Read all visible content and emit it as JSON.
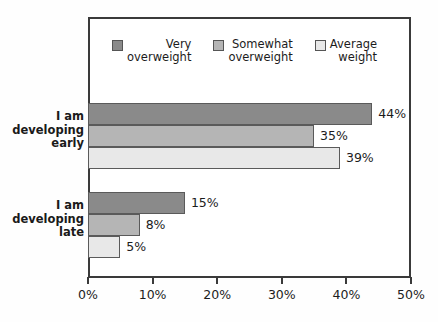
{
  "chart_data": {
    "type": "bar",
    "orientation": "horizontal",
    "title": "",
    "xlabel": "",
    "ylabel": "",
    "categories": [
      "I am developing early",
      "I am developing late"
    ],
    "category_lines": [
      [
        "I am",
        "developing",
        "early"
      ],
      [
        "I am",
        "developing",
        "late"
      ]
    ],
    "series": [
      {
        "name": "Very overweight",
        "name_lines": [
          "Very",
          "overweight"
        ],
        "color": "#8a8a8a",
        "values": [
          44,
          35
        ],
        "labels": [
          "44%",
          "8%"
        ]
      },
      {
        "name": "Somewhat overweight",
        "name_lines": [
          "Somewhat",
          "overweight"
        ],
        "color": "#b5b5b5",
        "values": [
          35,
          8
        ],
        "labels": [
          "35%",
          "8%"
        ]
      },
      {
        "name": "Average weight",
        "name_lines": [
          "Average",
          "weight"
        ],
        "color": "#e8e8e8",
        "values": [
          39,
          5
        ],
        "labels": [
          "39%",
          "5%"
        ]
      }
    ],
    "bars": [
      {
        "category": "I am developing early",
        "series": "Very overweight",
        "value": 44,
        "label": "44%",
        "color": "#8a8a8a"
      },
      {
        "category": "I am developing early",
        "series": "Somewhat overweight",
        "value": 35,
        "label": "35%",
        "color": "#b5b5b5"
      },
      {
        "category": "I am developing early",
        "series": "Average weight",
        "value": 39,
        "label": "39%",
        "color": "#e8e8e8"
      },
      {
        "category": "I am developing late",
        "series": "Very overweight",
        "value": 15,
        "label": "15%",
        "color": "#8a8a8a"
      },
      {
        "category": "I am developing late",
        "series": "Somewhat overweight",
        "value": 8,
        "label": "8%",
        "color": "#b5b5b5"
      },
      {
        "category": "I am developing late",
        "series": "Average weight",
        "value": 5,
        "label": "5%",
        "color": "#e8e8e8"
      }
    ],
    "xlim": [
      0,
      50
    ],
    "xticks": [
      0,
      10,
      20,
      30,
      40,
      50
    ],
    "xtick_labels": [
      "0%",
      "10%",
      "20%",
      "30%",
      "40%",
      "50%"
    ],
    "grid": false,
    "legend_position": "top-inside",
    "value_label_suffix": "%"
  },
  "legend": {
    "items": [
      {
        "label_line1": "Very",
        "label_line2": "overweight",
        "color": "#8a8a8a"
      },
      {
        "label_line1": "Somewhat",
        "label_line2": "overweight",
        "color": "#b5b5b5"
      },
      {
        "label_line1": "Average",
        "label_line2": "weight",
        "color": "#e8e8e8"
      }
    ]
  },
  "axis": {
    "tick_labels": [
      "0%",
      "10%",
      "20%",
      "30%",
      "40%",
      "50%"
    ]
  },
  "categories": {
    "group0": {
      "line1": "I am",
      "line2": "developing",
      "line3": "early"
    },
    "group1": {
      "line1": "I am",
      "line2": "developing",
      "line3": "late"
    }
  },
  "values": {
    "early_very": "44%",
    "early_somewhat": "35%",
    "early_average": "39%",
    "late_very": "15%",
    "late_somewhat": "8%",
    "late_average": "5%"
  },
  "colors": {
    "very_overweight": "#8a8a8a",
    "somewhat_overweight": "#b5b5b5",
    "average_weight": "#e8e8e8",
    "frame": "#3a3a3a",
    "text": "#1c1c1c",
    "background": "#fefefe"
  }
}
